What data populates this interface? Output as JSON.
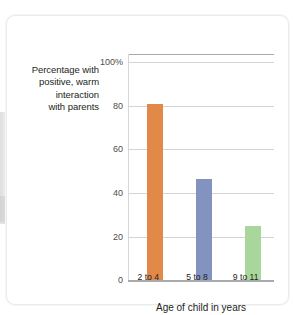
{
  "figure": {
    "y_axis_caption_lines": [
      "Percentage with",
      "positive, warm",
      "interaction",
      "with parents"
    ],
    "x_axis_title": "Age of child in years"
  },
  "chart_data": {
    "type": "bar",
    "title": "",
    "subtitle": "",
    "xlabel": "Age of child in years",
    "ylabel": "Percentage with positive, warm interaction with parents",
    "categories": [
      "2 to 4",
      "5 to 8",
      "9 to 11"
    ],
    "values": [
      81,
      46.5,
      25
    ],
    "bar_colors": [
      "#e2894a",
      "#8293c0",
      "#a9d69b"
    ],
    "ylim": [
      0,
      100
    ],
    "ytick_labels": [
      "0",
      "20",
      "40",
      "60",
      "80",
      "100%"
    ],
    "ytick_values": [
      0,
      20,
      40,
      60,
      80,
      100
    ],
    "grid": "horizontal",
    "legend": "none"
  },
  "colors": {
    "orange": "#e2894a",
    "blue": "#8293c0",
    "green": "#a9d69b",
    "gridline": "#d3d4d5",
    "axis": "#a7a9ac",
    "text": "#231f20"
  }
}
